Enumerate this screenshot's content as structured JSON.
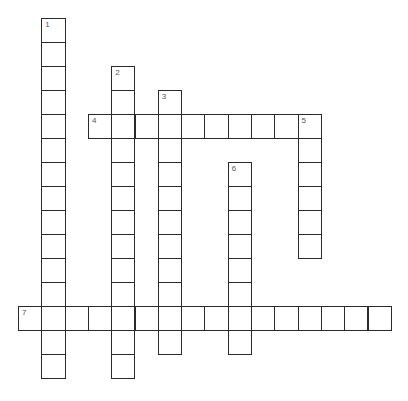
{
  "puzzle": {
    "type": "crossword",
    "entries": [
      {
        "number": "1",
        "direction": "down",
        "row": 0,
        "col": 1,
        "length": 15
      },
      {
        "number": "2",
        "direction": "down",
        "row": 2,
        "col": 4,
        "length": 13
      },
      {
        "number": "3",
        "direction": "down",
        "row": 3,
        "col": 6,
        "length": 11
      },
      {
        "number": "4",
        "direction": "across",
        "row": 4,
        "col": 3,
        "length": 10
      },
      {
        "number": "5",
        "direction": "down",
        "row": 4,
        "col": 12,
        "length": 6
      },
      {
        "number": "6",
        "direction": "down",
        "row": 6,
        "col": 9,
        "length": 8
      },
      {
        "number": "7",
        "direction": "across",
        "row": 12,
        "col": 0,
        "length": 16
      }
    ]
  }
}
